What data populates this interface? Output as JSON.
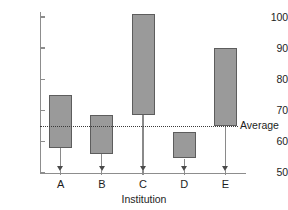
{
  "chart_data": {
    "type": "bar",
    "subtype": "floating-range-bar",
    "title": "",
    "xlabel": "Institution",
    "ylabel": "",
    "categories": [
      "A",
      "B",
      "C",
      "D",
      "E"
    ],
    "series": [
      {
        "name": "Range",
        "low": [
          58,
          56,
          68.5,
          54.5,
          65
        ],
        "high": [
          75,
          68.5,
          101,
          63,
          90
        ]
      }
    ],
    "ylim": [
      50,
      100
    ],
    "yticks": [
      50,
      60,
      70,
      80,
      90,
      100
    ],
    "ytick_labels": [
      "50",
      "60",
      "70",
      "80",
      "90",
      "100"
    ],
    "grid": false,
    "legend": "none",
    "annotations": [
      {
        "name": "average-reference-line",
        "label": "Average",
        "value": 65,
        "style": "dotted",
        "label_position": "right"
      }
    ],
    "bar_fill_color": "#9a9a9a",
    "bar_edge_color": "#5d5d5d",
    "axis_color": "#8d8d8d",
    "text_color": "#1d1d1d",
    "annotation_color": "#3a3a3a"
  }
}
